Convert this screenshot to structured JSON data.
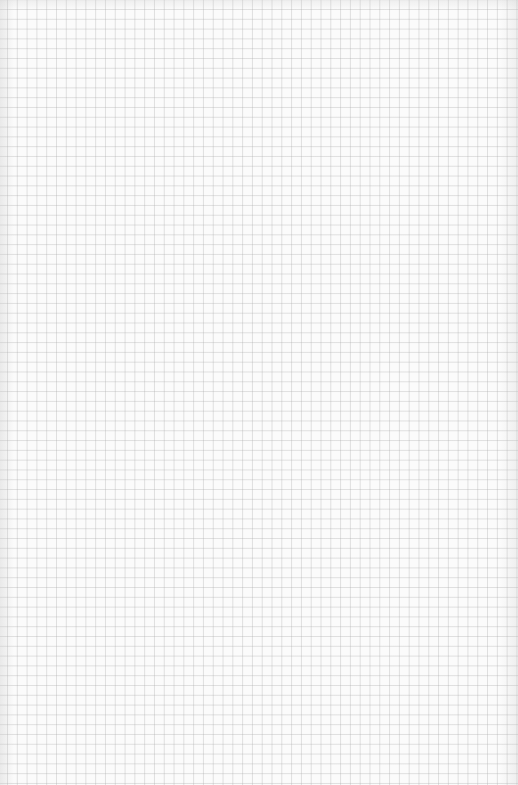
{
  "page": {
    "type": "graph-paper",
    "background_color": "#fbfbfb",
    "grid_line_color": "#d6d6d6",
    "grid_spacing_px": 10
  }
}
